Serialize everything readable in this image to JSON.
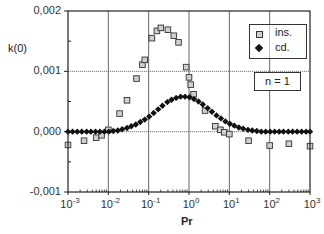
{
  "chart_data": {
    "type": "scatter",
    "title": "",
    "xlabel": "Pr",
    "ylabel": "k(0)",
    "xscale": "log",
    "xlim": [
      0.001,
      1000
    ],
    "ylim": [
      -0.001,
      0.002
    ],
    "x_tick_labels": [
      {
        "base": "10",
        "exp": "-3"
      },
      {
        "base": "10",
        "exp": "-2"
      },
      {
        "base": "10",
        "exp": "-1"
      },
      {
        "base": "10",
        "exp": "0"
      },
      {
        "base": "10",
        "exp": "1"
      },
      {
        "base": "10",
        "exp": "2"
      },
      {
        "base": "10",
        "exp": "3"
      }
    ],
    "y_tick_labels": [
      "0,002",
      "0,001",
      "0,000",
      "-0,001"
    ],
    "y_ticks": [
      0.002,
      0.001,
      0.0,
      -0.001
    ],
    "grid": true,
    "legend_position": "upper right",
    "annotation": "n = 1",
    "series": [
      {
        "name": "ins.",
        "marker": "square",
        "points": [
          [
            0.001,
            -0.00022
          ],
          [
            0.0025,
            -0.00015
          ],
          [
            0.005,
            -0.0001
          ],
          [
            0.0068,
            -6e-05
          ],
          [
            0.01,
            3e-05
          ],
          [
            0.019,
            0.0003
          ],
          [
            0.029,
            0.00052
          ],
          [
            0.05,
            0.00088
          ],
          [
            0.07,
            0.00111
          ],
          [
            0.08,
            0.00119
          ],
          [
            0.12,
            0.00155
          ],
          [
            0.16,
            0.00167
          ],
          [
            0.2,
            0.00172
          ],
          [
            0.3,
            0.00169
          ],
          [
            0.42,
            0.00159
          ],
          [
            0.55,
            0.00148
          ],
          [
            0.85,
            0.00107
          ],
          [
            1.0,
            0.0009
          ],
          [
            1.1,
            0.00078
          ],
          [
            1.3,
            0.00062
          ],
          [
            2.5,
            0.00035
          ],
          [
            4.5,
            9e-05
          ],
          [
            6.0,
            3e-05
          ],
          [
            7.5,
            -1e-05
          ],
          [
            10.0,
            -4e-05
          ],
          [
            30,
            -0.00015
          ],
          [
            100,
            -0.00023
          ],
          [
            300,
            -0.0002
          ],
          [
            1000,
            -0.00024
          ]
        ]
      },
      {
        "name": "cd.",
        "marker": "diamond",
        "points": [
          [
            0.001,
            0.0
          ],
          [
            0.0013,
            0.0
          ],
          [
            0.0017,
            0.0
          ],
          [
            0.0022,
            0.0
          ],
          [
            0.0029,
            0.0
          ],
          [
            0.0037,
            0.0
          ],
          [
            0.0048,
            0.0
          ],
          [
            0.0062,
            0.0
          ],
          [
            0.008,
            0.0
          ],
          [
            0.0103,
            0.0
          ],
          [
            0.0133,
            1e-05
          ],
          [
            0.0172,
            2e-05
          ],
          [
            0.022,
            4e-05
          ],
          [
            0.029,
            6e-05
          ],
          [
            0.037,
            9e-05
          ],
          [
            0.048,
            0.00012
          ],
          [
            0.062,
            0.00016
          ],
          [
            0.08,
            0.0002
          ],
          [
            0.103,
            0.00025
          ],
          [
            0.133,
            0.00031
          ],
          [
            0.172,
            0.00037
          ],
          [
            0.22,
            0.00043
          ],
          [
            0.29,
            0.00049
          ],
          [
            0.37,
            0.00053
          ],
          [
            0.48,
            0.00056
          ],
          [
            0.62,
            0.00058
          ],
          [
            0.8,
            0.00058
          ],
          [
            1.03,
            0.00057
          ],
          [
            1.33,
            0.00054
          ],
          [
            1.72,
            0.0005
          ],
          [
            2.2,
            0.00045
          ],
          [
            2.9,
            0.00039
          ],
          [
            3.7,
            0.00033
          ],
          [
            4.8,
            0.00027
          ],
          [
            6.2,
            0.00022
          ],
          [
            8.0,
            0.00017
          ],
          [
            10.3,
            0.00013
          ],
          [
            13.3,
            0.0001
          ],
          [
            17.2,
            7e-05
          ],
          [
            22,
            5e-05
          ],
          [
            29,
            3e-05
          ],
          [
            37,
            2e-05
          ],
          [
            48,
            1e-05
          ],
          [
            62,
            0.0
          ],
          [
            80,
            0.0
          ],
          [
            103,
            0.0
          ],
          [
            133,
            0.0
          ],
          [
            172,
            0.0
          ],
          [
            220,
            0.0
          ],
          [
            290,
            0.0
          ],
          [
            370,
            0.0
          ],
          [
            480,
            0.0
          ],
          [
            620,
            0.0
          ],
          [
            800,
            0.0
          ],
          [
            1000,
            0.0
          ]
        ]
      }
    ]
  },
  "legend": {
    "items": [
      {
        "label": "ins.",
        "marker": "square"
      },
      {
        "label": "cd.",
        "marker": "diamond"
      }
    ]
  },
  "annotation_box": {
    "text": "n = 1"
  },
  "colors": {
    "axis": "#222222",
    "grid": "#555555",
    "marker_square_fill": "#cfcfcf",
    "marker_square_stroke": "#333333",
    "marker_diamond": "#111111"
  }
}
